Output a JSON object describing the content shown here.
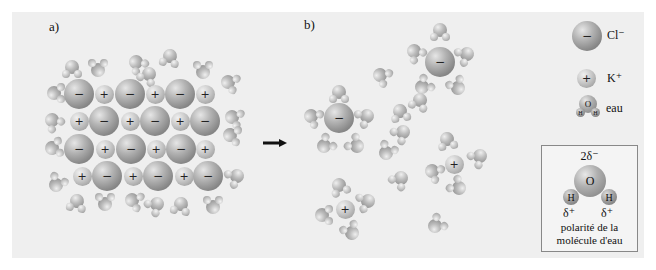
{
  "panels": {
    "a_label": "a)",
    "b_label": "b)"
  },
  "symbols": {
    "anion_sign": "−",
    "cation_sign": "+"
  },
  "legend": {
    "chloride": {
      "symbol": "−",
      "label": "Cl⁻"
    },
    "potassium": {
      "symbol": "+",
      "label": "K⁺"
    },
    "water": {
      "label": "eau",
      "o": "O",
      "h": "H"
    }
  },
  "polarity_box": {
    "delta_minus": "2δ⁻",
    "oxygen": "O",
    "hydrogen_left": "H",
    "hydrogen_right": "H",
    "delta_plus_left": "δ⁺",
    "delta_plus_right": "δ⁺",
    "caption_line1": "polarité de la",
    "caption_line2": "molécule d'eau"
  },
  "colors": {
    "background": "#efefef",
    "ion_gray": "#9a9a9a",
    "arrow": "#111111"
  },
  "lattice": [
    {
      "t": "cl",
      "x": 79,
      "y": 94
    },
    {
      "t": "k",
      "x": 104,
      "y": 94
    },
    {
      "t": "cl",
      "x": 130,
      "y": 94
    },
    {
      "t": "k",
      "x": 155,
      "y": 94
    },
    {
      "t": "cl",
      "x": 180,
      "y": 94
    },
    {
      "t": "k",
      "x": 205,
      "y": 94
    },
    {
      "t": "k",
      "x": 79,
      "y": 121
    },
    {
      "t": "cl",
      "x": 104,
      "y": 121
    },
    {
      "t": "k",
      "x": 130,
      "y": 121
    },
    {
      "t": "cl",
      "x": 155,
      "y": 121
    },
    {
      "t": "k",
      "x": 180,
      "y": 121
    },
    {
      "t": "cl",
      "x": 205,
      "y": 121
    },
    {
      "t": "cl",
      "x": 79,
      "y": 149
    },
    {
      "t": "k",
      "x": 105,
      "y": 149
    },
    {
      "t": "cl",
      "x": 131,
      "y": 149
    },
    {
      "t": "k",
      "x": 156,
      "y": 149
    },
    {
      "t": "cl",
      "x": 181,
      "y": 149
    },
    {
      "t": "k",
      "x": 205,
      "y": 149
    },
    {
      "t": "k",
      "x": 82,
      "y": 176
    },
    {
      "t": "cl",
      "x": 107,
      "y": 176
    },
    {
      "t": "k",
      "x": 133,
      "y": 176
    },
    {
      "t": "cl",
      "x": 158,
      "y": 176
    },
    {
      "t": "k",
      "x": 184,
      "y": 176
    },
    {
      "t": "cl",
      "x": 208,
      "y": 176
    }
  ],
  "lattice_waters": [
    {
      "x": 72,
      "y": 67,
      "r": 0
    },
    {
      "x": 98,
      "y": 70,
      "r": 180
    },
    {
      "x": 136,
      "y": 62,
      "r": -40
    },
    {
      "x": 149,
      "y": 74,
      "r": 30
    },
    {
      "x": 170,
      "y": 56,
      "r": 10
    },
    {
      "x": 203,
      "y": 72,
      "r": 180
    },
    {
      "x": 228,
      "y": 82,
      "r": -70
    },
    {
      "x": 54,
      "y": 93,
      "r": -90
    },
    {
      "x": 232,
      "y": 117,
      "r": -70
    },
    {
      "x": 52,
      "y": 120,
      "r": -40
    },
    {
      "x": 230,
      "y": 135,
      "r": -80
    },
    {
      "x": 52,
      "y": 148,
      "r": -100
    },
    {
      "x": 237,
      "y": 176,
      "r": 60
    },
    {
      "x": 56,
      "y": 185,
      "r": -150
    },
    {
      "x": 77,
      "y": 201,
      "r": 10
    },
    {
      "x": 105,
      "y": 204,
      "r": 180
    },
    {
      "x": 132,
      "y": 200,
      "r": -70
    },
    {
      "x": 157,
      "y": 204,
      "r": 50
    },
    {
      "x": 181,
      "y": 204,
      "r": 10
    },
    {
      "x": 213,
      "y": 207,
      "r": 180
    }
  ],
  "solution_ions": [
    {
      "t": "cl",
      "x": 440,
      "y": 62
    },
    {
      "t": "cl",
      "x": 339,
      "y": 118
    },
    {
      "t": "k",
      "x": 454,
      "y": 164
    },
    {
      "t": "k",
      "x": 345,
      "y": 209
    }
  ],
  "solution_waters": [
    {
      "x": 440,
      "y": 30,
      "r": 0
    },
    {
      "x": 414,
      "y": 51,
      "r": -40
    },
    {
      "x": 467,
      "y": 54,
      "r": 60
    },
    {
      "x": 422,
      "y": 87,
      "r": -130
    },
    {
      "x": 458,
      "y": 88,
      "r": 150
    },
    {
      "x": 380,
      "y": 75,
      "r": -60
    },
    {
      "x": 339,
      "y": 92,
      "r": 0
    },
    {
      "x": 311,
      "y": 116,
      "r": -60
    },
    {
      "x": 367,
      "y": 116,
      "r": 60
    },
    {
      "x": 324,
      "y": 146,
      "r": -130
    },
    {
      "x": 357,
      "y": 146,
      "r": 130
    },
    {
      "x": 400,
      "y": 111,
      "r": -10
    },
    {
      "x": 403,
      "y": 132,
      "r": 50
    },
    {
      "x": 386,
      "y": 153,
      "r": -150
    },
    {
      "x": 447,
      "y": 139,
      "r": -10
    },
    {
      "x": 432,
      "y": 171,
      "r": -60
    },
    {
      "x": 480,
      "y": 156,
      "r": 50
    },
    {
      "x": 459,
      "y": 188,
      "r": 130
    },
    {
      "x": 339,
      "y": 185,
      "r": -20
    },
    {
      "x": 368,
      "y": 201,
      "r": 70
    },
    {
      "x": 322,
      "y": 215,
      "r": -90
    },
    {
      "x": 352,
      "y": 233,
      "r": 150
    },
    {
      "x": 435,
      "y": 226,
      "r": -130
    },
    {
      "x": 401,
      "y": 178,
      "r": 40
    },
    {
      "x": 420,
      "y": 100,
      "r": 20
    }
  ]
}
